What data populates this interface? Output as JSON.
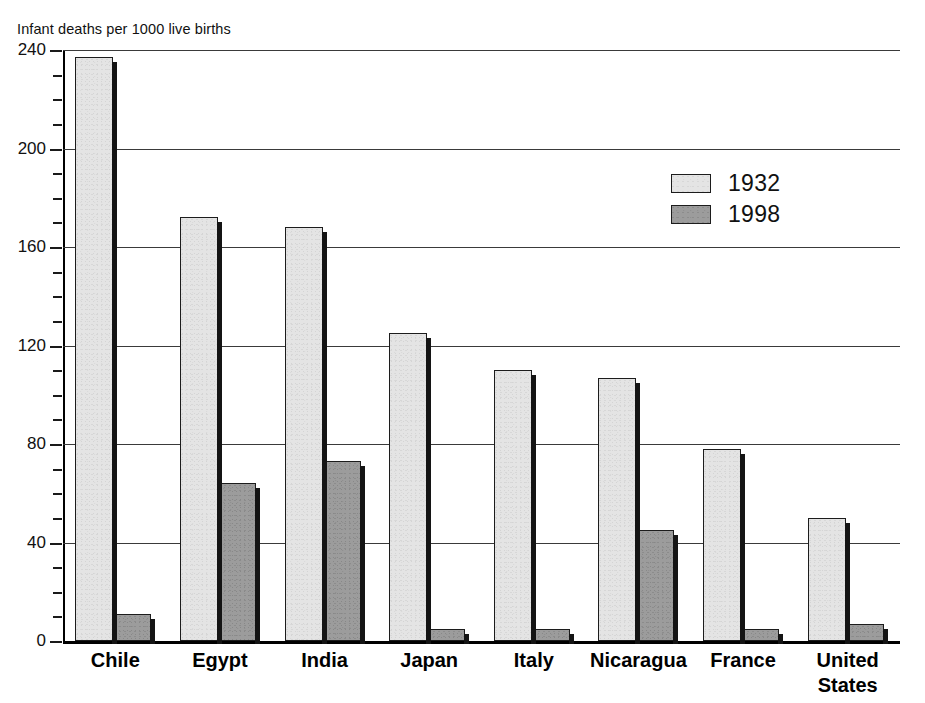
{
  "chart_data": {
    "type": "bar",
    "title": "Infant deaths per 1000 live births",
    "xlabel": "",
    "ylabel": "",
    "ylim": [
      0,
      240
    ],
    "ytick_step": 40,
    "yminor_step": 10,
    "grid": true,
    "legend_position": "inside-upper-right",
    "categories": [
      "Chile",
      "Egypt",
      "India",
      "Japan",
      "Italy",
      "Nicaragua",
      "France",
      "United\nStates"
    ],
    "ytick_labels": [
      "0",
      "40",
      "80",
      "120",
      "160",
      "200",
      "240"
    ],
    "ytick_values": [
      0,
      40,
      80,
      120,
      160,
      200,
      240
    ],
    "series": [
      {
        "name": "1932",
        "color": "#e4e4e4",
        "values": [
          237,
          172,
          168,
          125,
          110,
          107,
          78,
          50
        ]
      },
      {
        "name": "1998",
        "color": "#9c9c9c",
        "values": [
          11,
          64,
          73,
          5,
          5,
          45,
          5,
          7
        ]
      }
    ]
  },
  "legend": {
    "entries": [
      {
        "label": "1932"
      },
      {
        "label": "1998"
      }
    ]
  },
  "colors": {
    "series_1932": "#e4e4e4",
    "series_1998": "#9c9c9c",
    "gridline": "#3a3a3a",
    "axis": "#000000",
    "text": "#111111",
    "background": "#ffffff"
  }
}
